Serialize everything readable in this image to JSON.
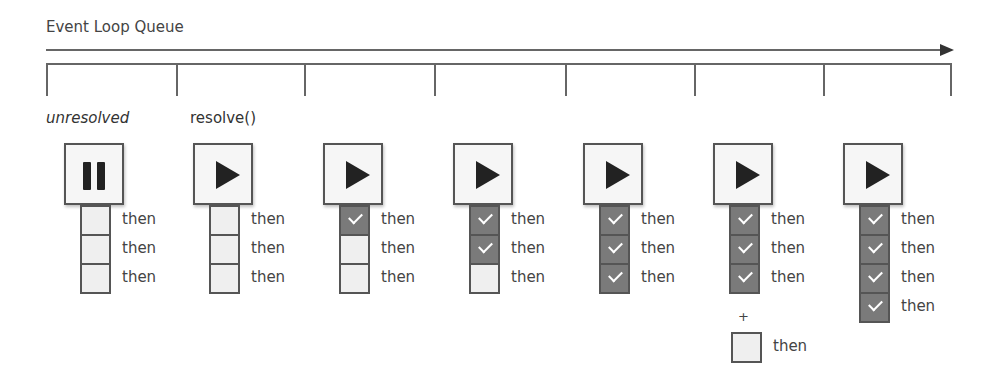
{
  "title": "Event Loop Queue",
  "timeline": {
    "tick_positions": [
      46,
      176,
      304,
      434,
      565,
      694,
      823,
      950
    ]
  },
  "states": [
    {
      "label": "unresolved",
      "italic": true,
      "icon": "pause-icon",
      "x": 64,
      "then_label": "then",
      "callbacks": [
        false,
        false,
        false
      ]
    },
    {
      "label": "resolve()",
      "italic": false,
      "icon": "play-icon",
      "x": 193,
      "then_label": "then",
      "callbacks": [
        false,
        false,
        false
      ]
    },
    {
      "label": "",
      "icon": "play-icon",
      "x": 323,
      "then_label": "then",
      "callbacks": [
        true,
        false,
        false
      ]
    },
    {
      "label": "",
      "icon": "play-icon",
      "x": 453,
      "then_label": "then",
      "callbacks": [
        true,
        true,
        false
      ]
    },
    {
      "label": "",
      "icon": "play-icon",
      "x": 583,
      "then_label": "then",
      "callbacks": [
        true,
        true,
        true
      ]
    },
    {
      "label": "",
      "icon": "play-icon",
      "x": 713,
      "then_label": "then",
      "callbacks": [
        true,
        true,
        true
      ],
      "added": {
        "plus": "+",
        "then_label": "then"
      }
    },
    {
      "label": "",
      "icon": "play-icon",
      "x": 843,
      "then_label": "then",
      "callbacks": [
        true,
        true,
        true,
        true
      ]
    }
  ],
  "colors": {
    "done": "#7a7a7a",
    "pending": "#efefef",
    "border": "#555555"
  }
}
